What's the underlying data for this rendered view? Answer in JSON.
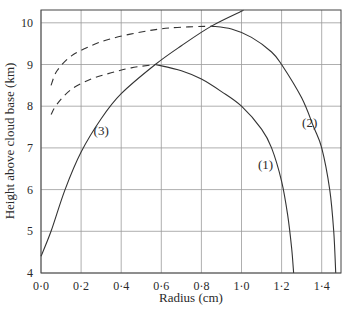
{
  "chart_data": {
    "type": "line",
    "title": "",
    "xlabel": "Radius (cm)",
    "ylabel": "Height above cloud base (km)",
    "xlim": [
      0.0,
      1.5
    ],
    "ylim": [
      4,
      10.3
    ],
    "x_ticks": [
      "0·0",
      "0·2",
      "0·4",
      "0·6",
      "0·8",
      "1·0",
      "1·2",
      "1·4"
    ],
    "y_ticks": [
      "4",
      "5",
      "6",
      "7",
      "8",
      "9",
      "10"
    ],
    "grid": true,
    "series": [
      {
        "name": "(1)",
        "style": "solid",
        "points": [
          [
            0.57,
            9.0
          ],
          [
            0.7,
            8.85
          ],
          [
            0.8,
            8.65
          ],
          [
            0.9,
            8.35
          ],
          [
            1.0,
            8.0
          ],
          [
            1.1,
            7.45
          ],
          [
            1.15,
            7.0
          ],
          [
            1.2,
            6.2
          ],
          [
            1.23,
            5.4
          ],
          [
            1.25,
            4.6
          ],
          [
            1.26,
            4.0
          ]
        ]
      },
      {
        "name": "(1) dashed",
        "style": "dashed",
        "points": [
          [
            0.05,
            7.8
          ],
          [
            0.08,
            8.05
          ],
          [
            0.15,
            8.4
          ],
          [
            0.25,
            8.65
          ],
          [
            0.35,
            8.8
          ],
          [
            0.45,
            8.92
          ],
          [
            0.57,
            9.0
          ]
        ]
      },
      {
        "name": "(2)",
        "style": "solid",
        "points": [
          [
            0.85,
            9.92
          ],
          [
            0.95,
            9.85
          ],
          [
            1.05,
            9.65
          ],
          [
            1.15,
            9.3
          ],
          [
            1.2,
            9.0
          ],
          [
            1.3,
            8.2
          ],
          [
            1.36,
            7.5
          ],
          [
            1.4,
            7.0
          ],
          [
            1.44,
            6.0
          ],
          [
            1.46,
            5.0
          ],
          [
            1.47,
            4.0
          ]
        ]
      },
      {
        "name": "(2) dashed",
        "style": "dashed",
        "points": [
          [
            0.05,
            8.5
          ],
          [
            0.08,
            8.85
          ],
          [
            0.15,
            9.2
          ],
          [
            0.25,
            9.45
          ],
          [
            0.35,
            9.62
          ],
          [
            0.5,
            9.78
          ],
          [
            0.65,
            9.88
          ],
          [
            0.85,
            9.92
          ]
        ]
      },
      {
        "name": "(3)",
        "style": "solid",
        "points": [
          [
            0.0,
            4.4
          ],
          [
            0.05,
            5.0
          ],
          [
            0.12,
            6.0
          ],
          [
            0.2,
            6.9
          ],
          [
            0.3,
            7.7
          ],
          [
            0.4,
            8.3
          ],
          [
            0.57,
            9.0
          ],
          [
            0.7,
            9.45
          ],
          [
            0.85,
            9.92
          ],
          [
            1.01,
            10.3
          ]
        ]
      }
    ],
    "annotations": [
      {
        "text": "(1)",
        "x": 1.12,
        "y": 6.5
      },
      {
        "text": "(2)",
        "x": 1.34,
        "y": 7.5
      },
      {
        "text": "(3)",
        "x": 0.3,
        "y": 7.3
      }
    ]
  }
}
